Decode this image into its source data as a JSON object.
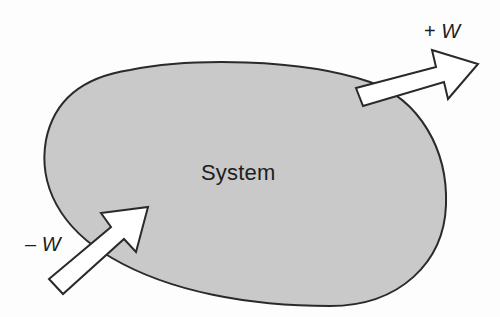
{
  "diagram": {
    "type": "system-boundary-work-diagram",
    "colors": {
      "background": "#fdfdfd",
      "system_fill": "#c9c9c9",
      "outline": "#2a2a2a",
      "arrow_fill": "#ffffff",
      "text": "#1e1e1e"
    },
    "system": {
      "label": "System"
    },
    "arrows": [
      {
        "id": "work-out",
        "direction": "outward",
        "sign": "+",
        "symbol": "W",
        "label": "+ W"
      },
      {
        "id": "work-in",
        "direction": "inward",
        "sign": "–",
        "symbol": "W",
        "label": "– W"
      }
    ]
  }
}
